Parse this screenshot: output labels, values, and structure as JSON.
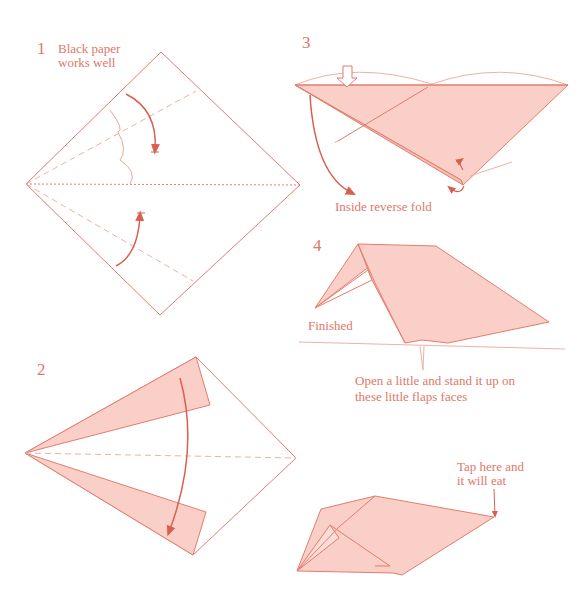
{
  "colors": {
    "stroke": "#e27d6e",
    "fill": "#f9cfc7",
    "text": "#e0786a",
    "arrow": "#d9604f"
  },
  "steps": [
    {
      "number": "1",
      "note": "Black paper works well",
      "note_lines": [
        "Black paper",
        "works well"
      ]
    },
    {
      "number": "2"
    },
    {
      "number": "3",
      "note": "Inside reverse fold"
    },
    {
      "number": "4",
      "note": "Finished",
      "instruction_lines": [
        "Open a little and stand it up on",
        "these little flaps faces"
      ]
    },
    {
      "number": "",
      "note_lines": [
        "Tap here and",
        "it will eat"
      ]
    }
  ]
}
